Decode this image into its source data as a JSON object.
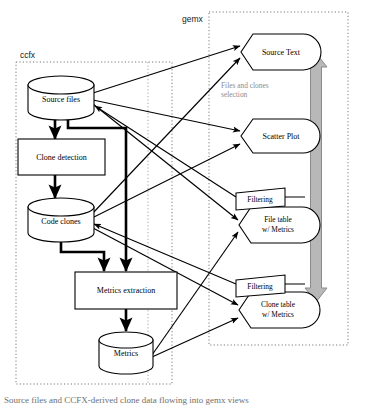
{
  "figure": {
    "caption": "Source files and CCFX-derived clone data flowing into gemx views"
  },
  "groups": [
    {
      "id": "ccfx",
      "label": "ccfx",
      "x": 16,
      "y": 62,
      "w": 156,
      "h": 322,
      "label_x": 20,
      "label_y": 58
    },
    {
      "id": "gemx",
      "label": "gemx",
      "x": 209,
      "y": 12,
      "w": 139,
      "h": 333,
      "label_x": 182,
      "label_y": 22
    }
  ],
  "nodes": {
    "source_files": {
      "label": "Source files",
      "shape": "cylinder",
      "cx": 61,
      "cy": 98
    },
    "clone_detection": {
      "label": "Clone detection",
      "shape": "process",
      "cx": 61,
      "cy": 157
    },
    "code_clones": {
      "label": "Code clones",
      "shape": "cylinder",
      "cx": 61,
      "cy": 220
    },
    "metrics_extraction": {
      "label": "Metrics extraction",
      "shape": "process",
      "cx": 126,
      "cy": 290
    },
    "metrics": {
      "label": "Metrics",
      "shape": "cylinder",
      "cx": 126,
      "cy": 350
    },
    "source_text": {
      "label": "Source Text",
      "shape": "display",
      "cx": 285,
      "cy": 52
    },
    "scatter_plot": {
      "label": "Scatter Plot",
      "shape": "display",
      "cx": 285,
      "cy": 136
    },
    "file_table": {
      "label_line1": "File table",
      "label_line2": "w/ Metrics",
      "shape": "display",
      "cx": 285,
      "cy": 225
    },
    "clone_table": {
      "label_line1": "Clone table",
      "label_line2": "w/ Metrics",
      "shape": "display",
      "cx": 285,
      "cy": 310
    },
    "filtering_file": {
      "label": "Filtering",
      "shape": "parallelogram",
      "cx": 257,
      "cy": 198
    },
    "filtering_clone": {
      "label": "Filtering",
      "shape": "parallelogram",
      "cx": 257,
      "cy": 285
    }
  },
  "annotations": {
    "selection_arrow_label_line1": "Files and clones",
    "selection_arrow_label_line2": "selection"
  },
  "colors": {
    "stroke": "#000000",
    "group_border": "#7a7a7a",
    "gray_arrow_fill": "#b8b8b8",
    "gray_arrow_stroke": "#8a8a8a",
    "gray_text": "#8d8d8d",
    "node_fill": "#ffffff"
  }
}
